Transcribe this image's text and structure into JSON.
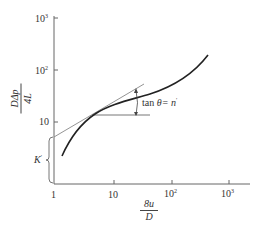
{
  "diagram": {
    "type": "log-log flow curve",
    "y_axis": {
      "label_numerator": "DΔp",
      "label_denominator": "4L",
      "ticks": [
        {
          "base": "10",
          "exp": "3"
        },
        {
          "base": "10",
          "exp": "2"
        },
        {
          "base": "10",
          "exp": ""
        }
      ]
    },
    "x_axis": {
      "label_numerator": "8u",
      "label_denominator": "D",
      "ticks": [
        {
          "base": "1",
          "exp": ""
        },
        {
          "base": "10",
          "exp": ""
        },
        {
          "base": "10",
          "exp": "2"
        },
        {
          "base": "10",
          "exp": "3"
        }
      ]
    },
    "annotations": {
      "slope": "tan θ = n′",
      "slope_prefix": "tan",
      "slope_theta": "θ",
      "slope_suffix": "= n",
      "slope_prime": "′",
      "intercept": "K",
      "intercept_prime": "′"
    },
    "colors": {
      "curve": "#222222",
      "axis": "#666666",
      "tangent": "#888888"
    }
  }
}
